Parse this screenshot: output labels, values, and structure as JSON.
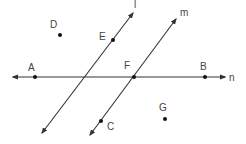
{
  "diagram": {
    "type": "geometry-lines-and-points",
    "lines": [
      {
        "name": "l",
        "label": "l",
        "x1": 42,
        "y1": 133,
        "x2": 133,
        "y2": 13,
        "label_x": 134,
        "label_y": 8
      },
      {
        "name": "m",
        "label": "m",
        "x1": 90,
        "y1": 135,
        "x2": 176,
        "y2": 19,
        "label_x": 180,
        "label_y": 16
      },
      {
        "name": "n",
        "label": "n",
        "x1": 13,
        "y1": 77,
        "x2": 225,
        "y2": 77,
        "label_x": 229,
        "label_y": 81
      }
    ],
    "points": [
      {
        "name": "A",
        "label": "A",
        "x": 35,
        "y": 77,
        "label_x": 28,
        "label_y": 71
      },
      {
        "name": "B",
        "label": "B",
        "x": 205,
        "y": 77,
        "label_x": 200,
        "label_y": 70
      },
      {
        "name": "C",
        "label": "C",
        "x": 101,
        "y": 121,
        "label_x": 107,
        "label_y": 130
      },
      {
        "name": "D",
        "label": "D",
        "x": 60,
        "y": 35,
        "label_x": 50,
        "label_y": 28
      },
      {
        "name": "E",
        "label": "E",
        "x": 113,
        "y": 40,
        "label_x": 99,
        "label_y": 40
      },
      {
        "name": "F",
        "label": "F",
        "x": 134,
        "y": 77,
        "label_x": 124,
        "label_y": 69
      },
      {
        "name": "G",
        "label": "G",
        "x": 165,
        "y": 119,
        "label_x": 159,
        "label_y": 111
      }
    ]
  }
}
